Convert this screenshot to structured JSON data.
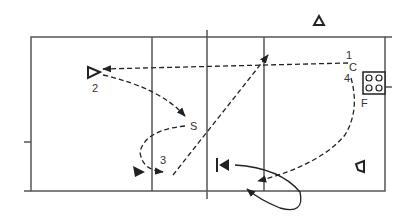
{
  "diagram": {
    "type": "volleyball-court-play-diagram",
    "colors": {
      "line": "#555555",
      "ink": "#222222",
      "background": "#ffffff"
    },
    "court": {
      "outline": {
        "left": 31,
        "top": 37,
        "right": 385,
        "bottom": 191
      },
      "center_line_x": 207,
      "attack_lines_x": [
        152,
        264
      ]
    },
    "labels": {
      "player1": "1",
      "player2": "2",
      "player3": "3",
      "player4": "4",
      "setter": "S",
      "coach": "C",
      "feeder": "F"
    },
    "icons": {
      "ball_cart": "ball-cart-icon",
      "player_open": "open-triangle-icon",
      "player_filled": "filled-triangle-icon",
      "blocker": "blocker-icon"
    }
  }
}
